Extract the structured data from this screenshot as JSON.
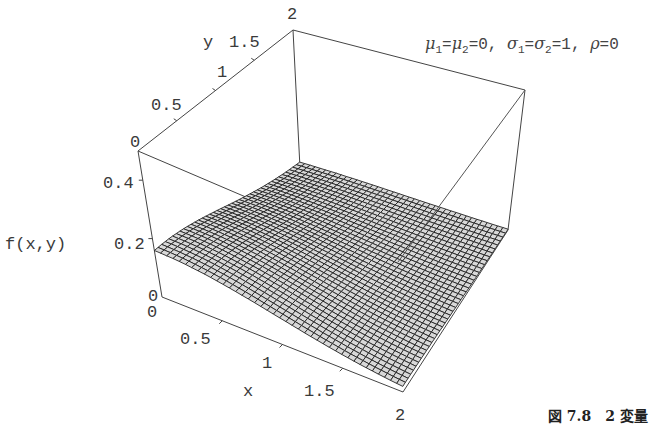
{
  "chart_data": {
    "type": "surface3d",
    "title": "",
    "annotation": "μ1=μ2=0, σ1=σ2=1, ρ=0",
    "function": "f(x,y) = 1/(2π) · exp(-(x²+y²)/2)",
    "xlabel": "x",
    "ylabel": "y",
    "zlabel": "f(x,y)",
    "xlim": [
      0,
      2
    ],
    "ylim": [
      0,
      2
    ],
    "zlim": [
      0,
      0.5
    ],
    "x_ticks": [
      "0",
      "0.5",
      "1",
      "1.5",
      "2"
    ],
    "y_ticks": [
      "0",
      "0.5",
      "1",
      "1.5",
      "2"
    ],
    "z_ticks": [
      "0",
      "0.2",
      "0.4"
    ],
    "grid": false,
    "mesh": {
      "x_lines": 40,
      "y_lines": 40
    },
    "surface_color": "#d8d8d8",
    "mesh_color": "#222222",
    "sample_values": [
      {
        "x": 0,
        "y": 0,
        "z": 0.159
      },
      {
        "x": 1,
        "y": 0,
        "z": 0.097
      },
      {
        "x": 2,
        "y": 0,
        "z": 0.022
      },
      {
        "x": 0,
        "y": 1,
        "z": 0.097
      },
      {
        "x": 1,
        "y": 1,
        "z": 0.059
      },
      {
        "x": 2,
        "y": 2,
        "z": 0.003
      }
    ]
  },
  "axes": {
    "z_label": "f(x,y)",
    "x_label": "x",
    "y_label": "y",
    "z_tick_0": "0",
    "z_tick_02": "0.2",
    "z_tick_04": "0.4",
    "x_tick_0": "0",
    "x_tick_05": "0.5",
    "x_tick_1": "1",
    "x_tick_15": "1.5",
    "x_tick_2": "2",
    "y_tick_0": "0",
    "y_tick_05": "0.5",
    "y_tick_1": "1",
    "y_tick_15": "1.5",
    "y_tick_2": "2"
  },
  "annotation": {
    "mu1": "μ",
    "s1": "1",
    "eq1": "=",
    "mu2": "μ",
    "s2": "2",
    "eq2": "=0, ",
    "sig1": "σ",
    "s3": "1",
    "eq3": "=",
    "sig2": "σ",
    "s4": "2",
    "eq4": "=1, ",
    "rho": "ρ",
    "eq5": "=0"
  },
  "caption": {
    "text": "図 7.8　2 変量"
  }
}
